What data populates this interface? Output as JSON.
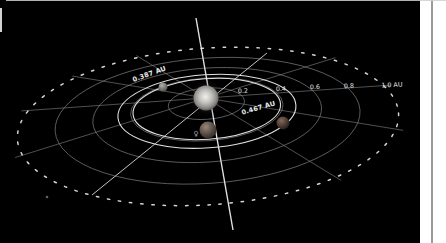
{
  "scene": {
    "canvas_bg": "#000000",
    "gutter_bg": "#ffffff",
    "divider_color": "#9b9b9b",
    "top_border_color": "#d0d0d0",
    "left_edge_color": "#e9e9e9"
  },
  "diagram": {
    "center_x": 206,
    "center_y": 98,
    "px_per_au": 191,
    "tilt_deg": -4,
    "squash": 0.41,
    "ring_drop_per_au": 69.5,
    "grid_color": "#8f8f8f",
    "bright_color": "#ededed",
    "dotted_color": "#d6d6d6",
    "label_color": "#e4e4e4",
    "grid_rings_au": [
      0.2,
      0.4,
      0.6,
      0.8
    ],
    "outer_ring_au": 1.0,
    "spoke_angles_deg": [
      0,
      30,
      60,
      150,
      180,
      210,
      240,
      330
    ],
    "special_lines": [
      {
        "name": "vertical-axis-line",
        "x1": 196,
        "y1": 18,
        "x2": 233,
        "y2": 230
      },
      {
        "name": "diagonal-axis-line",
        "x1": 267,
        "y1": 53,
        "x2": 92,
        "y2": 195
      }
    ],
    "axis_ticks": [
      {
        "label": "0.2",
        "x": 243,
        "y": 93,
        "rot": -3
      },
      {
        "label": "0.4",
        "x": 281,
        "y": 91,
        "rot": -3
      },
      {
        "label": "0.6",
        "x": 315,
        "y": 89,
        "rot": -3
      },
      {
        "label": "0.8",
        "x": 349,
        "y": 88,
        "rot": -3
      },
      {
        "label": "1.0 AU",
        "x": 392,
        "y": 87,
        "rot": -3
      }
    ],
    "orbits": [
      {
        "label": "0.387 AU",
        "radius_au": 0.387,
        "label_x": 150,
        "label_y": 76,
        "label_rot": -20
      },
      {
        "label": "0.467 AU",
        "radius_au": 0.467,
        "label_x": 259,
        "label_y": 110,
        "label_rot": -16
      }
    ],
    "sun": {
      "x": 206,
      "y": 98,
      "radius": 12.5,
      "halo_radius": 19,
      "core_color": "#f2f0ec",
      "mid_color": "#c4c2be",
      "edge_color": "#5f5d59"
    },
    "planets": [
      {
        "name": "planet-upper-left",
        "x": 163,
        "y": 87,
        "radius": 4.5,
        "hi": "#b3b1ad",
        "lo": "#4e4c49"
      },
      {
        "name": "planet-right",
        "x": 283,
        "y": 123,
        "radius": 6.5,
        "hi": "#84695a",
        "lo": "#1f1915"
      },
      {
        "name": "planet-front",
        "x": 208,
        "y": 130,
        "radius": 8.5,
        "hi": "#97867a",
        "lo": "#2a231e"
      }
    ],
    "planet_symbol": {
      "glyph": "♀",
      "x": 196,
      "y": 136,
      "color": "#a0a0a0"
    },
    "background_star": {
      "x": 47,
      "y": 197,
      "radius": 1.3,
      "color": "#7a7a7a"
    }
  }
}
